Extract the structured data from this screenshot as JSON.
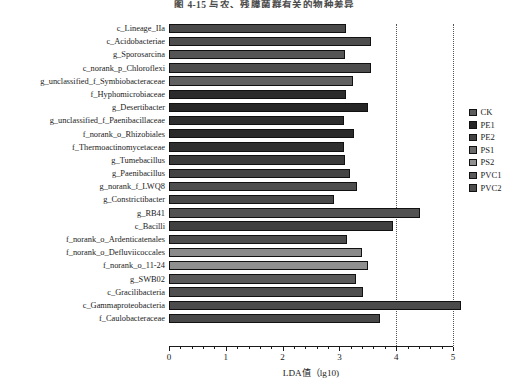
{
  "figure": {
    "title_visible_fragment": "图 4-15  与农、残膜菌群有关的物种差异"
  },
  "chart_data": {
    "type": "bar",
    "orientation": "horizontal",
    "title": "",
    "xlabel": "LDA值（lg10)",
    "ylabel": "",
    "xlim": [
      0,
      5.3
    ],
    "xticks": [
      0,
      1,
      2,
      3,
      4,
      5
    ],
    "xticklabels": [
      "0",
      "1",
      "2",
      "3",
      "4",
      "5"
    ],
    "grid": "vertical dotted at x=4 and x=5",
    "legend_position": "right",
    "categories": [
      "c_Lineage_IIa",
      "c_Acidobacteriae",
      "g_Sporosarcina",
      "c_norank_p_Chloroflexi",
      "g_unclassified_f_Symbiobacteraceae",
      "f_Hyphomicrobiaceae",
      "g_Desertibacter",
      "g_unclassified_f_Paenibacillaceae",
      "f_norank_o_Rhizobiales",
      "f_Thermoactinomycetaceae",
      "g_Tumebacillus",
      "g_Paenibacillus",
      "g_norank_f_LWQ8",
      "g_Constrictibacter",
      "g_RB41",
      "c_Bacilli",
      "f_norank_o_Ardenticatenales",
      "f_norank_o_Defluviicoccales",
      "f_norank_o_11-24",
      "g_SWB02",
      "c_Gracilibacteria",
      "c_Gammaproteobacteria",
      "f_Caulobacteraceae"
    ],
    "values": [
      3.11,
      3.55,
      3.09,
      3.55,
      3.24,
      3.12,
      3.51,
      3.08,
      3.26,
      3.08,
      3.1,
      3.19,
      3.31,
      2.9,
      4.42,
      3.95,
      3.13,
      3.39,
      3.5,
      3.3,
      3.42,
      5.14,
      3.72
    ],
    "bars": [
      {
        "label": "c_Lineage_IIa",
        "value": 3.11,
        "group": "PE2",
        "color": "#4a4a4a"
      },
      {
        "label": "c_Acidobacteriae",
        "value": 3.55,
        "group": "PE2",
        "color": "#4d4d4d"
      },
      {
        "label": "g_Sporosarcina",
        "value": 3.09,
        "group": "PVC2",
        "color": "#555555"
      },
      {
        "label": "c_norank_p_Chloroflexi",
        "value": 3.55,
        "group": "PE2",
        "color": "#4d4d4d"
      },
      {
        "label": "g_unclassified_f_Symbiobacteraceae",
        "value": 3.24,
        "group": "PVC1",
        "color": "#616161"
      },
      {
        "label": "f_Hyphomicrobiaceae",
        "value": 3.12,
        "group": "PE1",
        "color": "#2b2b2b"
      },
      {
        "label": "g_Desertibacter",
        "value": 3.51,
        "group": "PE1",
        "color": "#262626"
      },
      {
        "label": "g_unclassified_f_Paenibacillaceae",
        "value": 3.08,
        "group": "PE1",
        "color": "#2e2e2e"
      },
      {
        "label": "f_norank_o_Rhizobiales",
        "value": 3.26,
        "group": "PE1",
        "color": "#2a2a2a"
      },
      {
        "label": "f_Thermoactinomycetaceae",
        "value": 3.08,
        "group": "PE1",
        "color": "#303030"
      },
      {
        "label": "g_Tumebacillus",
        "value": 3.1,
        "group": "PE2",
        "color": "#3b3b3b"
      },
      {
        "label": "g_Paenibacillus",
        "value": 3.19,
        "group": "PE2",
        "color": "#444444"
      },
      {
        "label": "g_norank_f_LWQ8",
        "value": 3.31,
        "group": "PVC2",
        "color": "#4e4e4e"
      },
      {
        "label": "g_Constrictibacter",
        "value": 2.9,
        "group": "PE2",
        "color": "#484848"
      },
      {
        "label": "g_RB41",
        "value": 4.42,
        "group": "PVC2",
        "color": "#525252"
      },
      {
        "label": "c_Bacilli",
        "value": 3.95,
        "group": "PE2",
        "color": "#404040"
      },
      {
        "label": "f_norank_o_Ardenticatenales",
        "value": 3.13,
        "group": "PVC2",
        "color": "#4c4c4c"
      },
      {
        "label": "f_norank_o_Defluviicoccales",
        "value": 3.39,
        "group": "PS2",
        "color": "#8a8a8a"
      },
      {
        "label": "f_norank_o_11-24",
        "value": 3.5,
        "group": "PS2",
        "color": "#8f8f8f"
      },
      {
        "label": "g_SWB02",
        "value": 3.3,
        "group": "PVC1",
        "color": "#5a5a5a"
      },
      {
        "label": "c_Gracilibacteria",
        "value": 3.42,
        "group": "PVC1",
        "color": "#4f4f4f"
      },
      {
        "label": "c_Gammaproteobacteria",
        "value": 5.14,
        "group": "PVC2",
        "color": "#4b4b4b"
      },
      {
        "label": "f_Caulobacteraceae",
        "value": 3.72,
        "group": "PVC2",
        "color": "#484848"
      }
    ],
    "legend": [
      {
        "name": "CK",
        "color": "#5c5c5c"
      },
      {
        "name": "PE1",
        "color": "#262626"
      },
      {
        "name": "PE2",
        "color": "#434343"
      },
      {
        "name": "PS1",
        "color": "#6a6a6a"
      },
      {
        "name": "PS2",
        "color": "#8f8f8f"
      },
      {
        "name": "PVC1",
        "color": "#5a5a5a"
      },
      {
        "name": "PVC2",
        "color": "#4d4d4d"
      }
    ]
  }
}
